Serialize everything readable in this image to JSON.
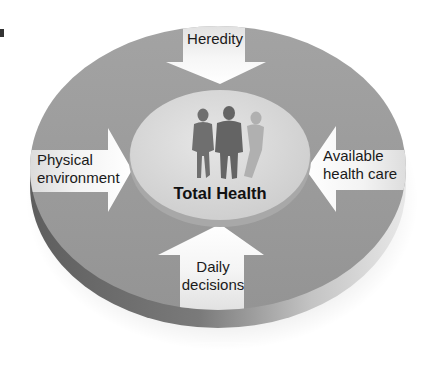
{
  "diagram": {
    "title": "Total Health",
    "center_icon": "people-silhouettes-icon",
    "influences": [
      {
        "id": "heredity",
        "label": "Heredity",
        "direction": "down"
      },
      {
        "id": "physical-environment",
        "label_lines": [
          "Physical",
          "environment"
        ],
        "direction": "right"
      },
      {
        "id": "available-health-care",
        "label_lines": [
          "Available",
          "health care"
        ],
        "direction": "left"
      },
      {
        "id": "daily-decisions",
        "label_lines": [
          "Daily",
          "decisions"
        ],
        "direction": "up"
      }
    ],
    "colors": {
      "disc_top": "#9a9a9a",
      "disc_rim_dark": "#6e6e6e",
      "disc_rim_light": "#d8d8d8",
      "center_disc": "#d9d9d9",
      "arrow_fill": "#f4f4f4",
      "figure": "#6f6f6f",
      "text": "#1a1a1a"
    }
  }
}
